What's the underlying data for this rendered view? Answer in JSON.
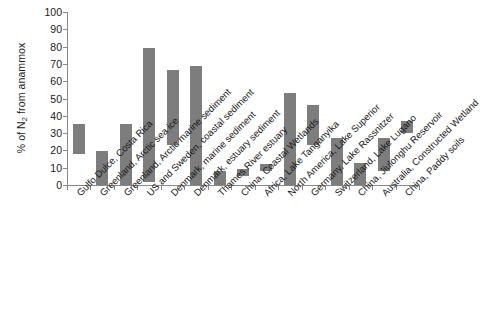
{
  "chart_data": {
    "type": "bar",
    "bar_style": "floating-range",
    "title": "",
    "xlabel": "",
    "ylabel": "% of N2 from anammox",
    "ylabel_display": "% of N",
    "ylabel_subscript": "2",
    "ylabel_suffix": " from anammox",
    "ylim": [
      0,
      100
    ],
    "yticks": [
      0,
      10,
      20,
      30,
      40,
      50,
      60,
      70,
      80,
      90,
      100
    ],
    "grid": false,
    "legend": false,
    "bar_color": "#7d7d7d",
    "axis_color": "#8a8a8a",
    "categories": [
      "Gulfo Dulce, Costa Rica",
      "Greenland, Arctic sea ice",
      "Greenland, Arctic marine sediment",
      "US and Sweden, coastal sediment",
      "Denmark, marine sediment",
      "Denmark, estuary sediment",
      "Thames River estuary",
      "China, Coastal Wetlands",
      "Africa, Lake Tanganyika",
      "North America, Lake Superior",
      "Germany, Lake Rassnitzer",
      "Switzerland, Lake Lugano",
      "China, Jiulonghu Reservoir",
      "Australia, Constructed Wetland",
      "China, Paddy soils"
    ],
    "low": [
      18,
      0,
      0,
      2,
      23,
      0,
      0,
      5,
      8,
      0,
      23,
      0,
      0,
      8,
      30
    ],
    "high": [
      35,
      19.5,
      35,
      79,
      66.5,
      69,
      8,
      9,
      12,
      53,
      46,
      27,
      13,
      27,
      37
    ],
    "values": [
      {
        "category": "Gulfo Dulce, Costa Rica",
        "low": 18,
        "high": 35
      },
      {
        "category": "Greenland, Arctic sea ice",
        "low": 0,
        "high": 19.5
      },
      {
        "category": "Greenland, Arctic marine sediment",
        "low": 0,
        "high": 35
      },
      {
        "category": "US and Sweden, coastal sediment",
        "low": 2,
        "high": 79
      },
      {
        "category": "Denmark, marine sediment",
        "low": 23,
        "high": 66.5
      },
      {
        "category": "Denmark, estuary sediment",
        "low": 0,
        "high": 69
      },
      {
        "category": "Thames River estuary",
        "low": 0,
        "high": 8
      },
      {
        "category": "China, Coastal Wetlands",
        "low": 5,
        "high": 9
      },
      {
        "category": "Africa, Lake Tanganyika",
        "low": 8,
        "high": 12
      },
      {
        "category": "North America, Lake Superior",
        "low": 0,
        "high": 53
      },
      {
        "category": "Germany, Lake Rassnitzer",
        "low": 23,
        "high": 46
      },
      {
        "category": "Switzerland, Lake Lugano",
        "low": 0,
        "high": 27
      },
      {
        "category": "China, Jiulonghu Reservoir",
        "low": 0,
        "high": 13
      },
      {
        "category": "Australia, Constructed Wetland",
        "low": 8,
        "high": 27
      },
      {
        "category": "China, Paddy soils",
        "low": 30,
        "high": 37
      }
    ]
  }
}
